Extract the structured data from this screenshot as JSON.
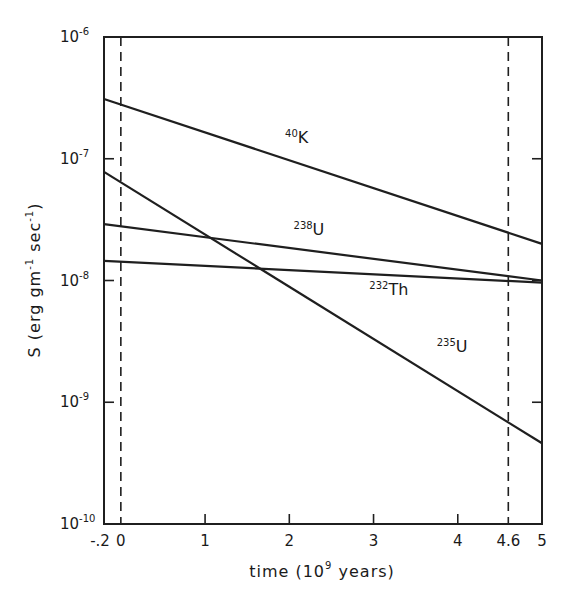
{
  "chart_data": {
    "type": "line",
    "title": "",
    "xlabel": "time (10^9 years)",
    "xlabel_parts": {
      "pre": "time (10",
      "sup": "9",
      "post": " years)"
    },
    "ylabel": "S (erg gm^-1 sec^-1)",
    "ylabel_parts": {
      "pre": "S (erg gm",
      "sup1": "-1",
      "mid": " sec",
      "sup2": "-1",
      "post": ")"
    },
    "xlim": [
      -0.2,
      5
    ],
    "ylim": [
      1e-10,
      1e-06
    ],
    "yscale": "log",
    "grid": false,
    "x_ticks": [
      {
        "value": -0.2,
        "label": "-.2"
      },
      {
        "value": 0,
        "label": "0"
      },
      {
        "value": 1,
        "label": "1"
      },
      {
        "value": 2,
        "label": "2"
      },
      {
        "value": 3,
        "label": "3"
      },
      {
        "value": 4,
        "label": "4"
      },
      {
        "value": 4.6,
        "label": "4.6"
      },
      {
        "value": 5,
        "label": "5"
      }
    ],
    "y_ticks": [
      {
        "exp": -6,
        "base": "10",
        "sup": "-6"
      },
      {
        "exp": -7,
        "base": "10",
        "sup": "-7"
      },
      {
        "exp": -8,
        "base": "10",
        "sup": "-8"
      },
      {
        "exp": -9,
        "base": "10",
        "sup": "-9"
      },
      {
        "exp": -10,
        "base": "10",
        "sup": "-10"
      }
    ],
    "reference_lines": [
      {
        "x": 0,
        "style": "dashed"
      },
      {
        "x": 4.6,
        "style": "dashed"
      }
    ],
    "x": [
      -0.2,
      5
    ],
    "series": [
      {
        "name": "40K",
        "mass": "40",
        "element": "K",
        "values": [
          3.1e-07,
          2e-08
        ],
        "label_at": [
          1.95,
          1.35e-07
        ]
      },
      {
        "name": "238U",
        "mass": "238",
        "element": "U",
        "values": [
          2.9e-08,
          1e-08
        ],
        "label_at": [
          2.05,
          2.35e-08
        ]
      },
      {
        "name": "232Th",
        "mass": "232",
        "element": "Th",
        "values": [
          1.45e-08,
          9.6e-09
        ],
        "label_at": [
          2.95,
          7.6e-09
        ]
      },
      {
        "name": "235U",
        "mass": "235",
        "element": "U",
        "values": [
          7.8e-08,
          4.6e-10
        ],
        "label_at": [
          3.75,
          2.6e-09
        ]
      }
    ]
  }
}
